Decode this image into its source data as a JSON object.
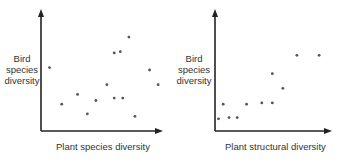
{
  "chart_data": [
    {
      "type": "scatter",
      "title": "",
      "xlabel": "Plant species diversity",
      "ylabel": "Bird species diversity",
      "ylabel_lines": [
        "Bird",
        "species",
        "diversity"
      ],
      "grid": false,
      "ticks": false,
      "legend": null,
      "points": [
        [
          0.07,
          0.52
        ],
        [
          0.17,
          0.22
        ],
        [
          0.3,
          0.3
        ],
        [
          0.38,
          0.14
        ],
        [
          0.45,
          0.25
        ],
        [
          0.54,
          0.38
        ],
        [
          0.6,
          0.64
        ],
        [
          0.65,
          0.65
        ],
        [
          0.6,
          0.27
        ],
        [
          0.67,
          0.27
        ],
        [
          0.72,
          0.77
        ],
        [
          0.77,
          0.12
        ],
        [
          0.89,
          0.5
        ],
        [
          0.96,
          0.38
        ]
      ]
    },
    {
      "type": "scatter",
      "title": "",
      "xlabel": "Plant structural diversity",
      "ylabel": "Bird species diversity",
      "ylabel_lines": [
        "Bird",
        "species",
        "diversity"
      ],
      "grid": false,
      "ticks": false,
      "legend": null,
      "points": [
        [
          0.03,
          0.1
        ],
        [
          0.07,
          0.22
        ],
        [
          0.12,
          0.11
        ],
        [
          0.19,
          0.11
        ],
        [
          0.27,
          0.22
        ],
        [
          0.4,
          0.23
        ],
        [
          0.49,
          0.23
        ],
        [
          0.49,
          0.47
        ],
        [
          0.58,
          0.35
        ],
        [
          0.7,
          0.62
        ],
        [
          0.89,
          0.62
        ]
      ]
    }
  ]
}
